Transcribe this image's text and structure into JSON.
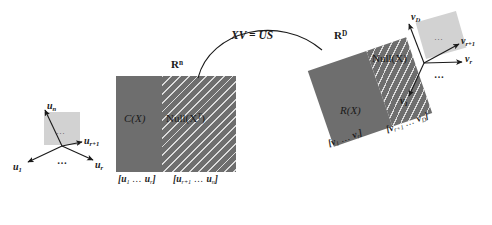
{
  "diagram": {
    "transform_label": "XV = US",
    "colors": {
      "block_fill": "#6e6e6e",
      "hatch": "#ffffff",
      "small_face": "#d2d2d2",
      "ink": "#1a1a1a",
      "background": "#ffffff"
    }
  },
  "left": {
    "space_label_base": "R",
    "space_label_exp": "n",
    "column_space_label": "C(X)",
    "null_space_label": "Null(X",
    "null_space_label_sup": "T",
    "null_space_label_end": ")",
    "basis_bracket_left": "[u",
    "basis_bracket_left_sub1": "1",
    "basis_bracket_left_dots": "…",
    "basis_bracket_left_u2": "u",
    "basis_bracket_left_sub2": "r",
    "basis_bracket_left_close": "]",
    "basis_bracket_right": "[u",
    "basis_bracket_right_sub1": "r+1",
    "basis_bracket_right_dots": "…",
    "basis_bracket_right_u2": "u",
    "basis_bracket_right_sub2": "n",
    "basis_bracket_right_close": "]",
    "vectors": [
      {
        "name": "u",
        "sub": "n"
      },
      {
        "name": "u",
        "sub": "r+1"
      },
      {
        "name": "u",
        "sub": "1"
      },
      {
        "name": "u",
        "sub": "r"
      }
    ],
    "ellipsis": "…"
  },
  "right": {
    "space_label_base": "R",
    "space_label_exp": "D",
    "row_space_label": "R(X)",
    "null_space_label": "Null(X)",
    "basis_bracket_left": "[v",
    "basis_bracket_left_sub1": "1",
    "basis_bracket_left_dots": "…",
    "basis_bracket_left_v2": "v",
    "basis_bracket_left_sub2": "r",
    "basis_bracket_left_close": "]",
    "basis_bracket_right": "[v",
    "basis_bracket_right_sub1": "r+1",
    "basis_bracket_right_dots": "…",
    "basis_bracket_right_v2": "v",
    "basis_bracket_right_sub2": "D",
    "basis_bracket_right_close": "]",
    "vectors": [
      {
        "name": "v",
        "sub": "D"
      },
      {
        "name": "v",
        "sub": "r+1"
      },
      {
        "name": "v",
        "sub": "r"
      },
      {
        "name": "v",
        "sub": "1"
      }
    ],
    "ellipsis": "…"
  }
}
